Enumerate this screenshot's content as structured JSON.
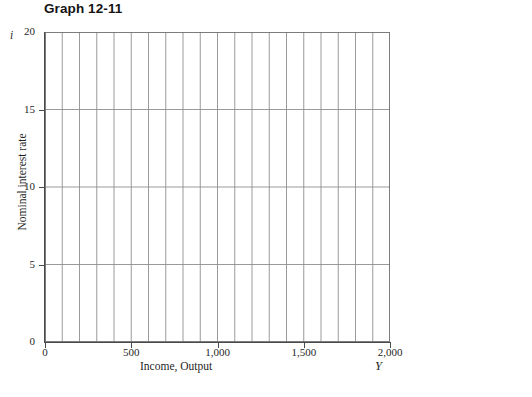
{
  "figure": {
    "title": "Graph 12-11"
  },
  "chart_data": {
    "type": "line",
    "title": "Graph 12-11",
    "subtitle": "",
    "series": [],
    "annotations": [],
    "xlabel": "Income, Output",
    "ylabel": "Nominal interest rate",
    "x_symbol": "Y",
    "y_symbol": "i",
    "xlim": [
      0,
      2000
    ],
    "ylim": [
      0,
      20
    ],
    "x_ticks": [
      0,
      500,
      1000,
      1500,
      2000
    ],
    "x_tick_labels": [
      "0",
      "500",
      "1,000",
      "1,500",
      "2,000"
    ],
    "y_ticks": [
      0,
      5,
      10,
      15,
      20
    ],
    "y_tick_labels": [
      "0",
      "5",
      "10",
      "15",
      "20"
    ],
    "grid": true,
    "grid_vertical_count": 20,
    "grid_vertical_step": 100,
    "grid_horizontal_step": 5,
    "legend": null,
    "legend_position": "none",
    "plot_empty": true,
    "note": "Blank worksheet grid with no plotted data series."
  },
  "axes": {
    "y_symbol": "i",
    "x_symbol": "Y",
    "y_title": "Nominal interest rate",
    "x_title": "Income, Output",
    "y_labels": [
      "20",
      "15",
      "10",
      "5",
      "0"
    ],
    "x_labels": [
      "0",
      "500",
      "1,000",
      "1,500",
      "2,000"
    ]
  },
  "colors": {
    "grid_major": "#8e8e8e",
    "grid_minor": "#b9b9b9",
    "axis": "#4a4a4a",
    "text": "#1f1f1f",
    "title": "#141414",
    "background": "#ffffff"
  }
}
